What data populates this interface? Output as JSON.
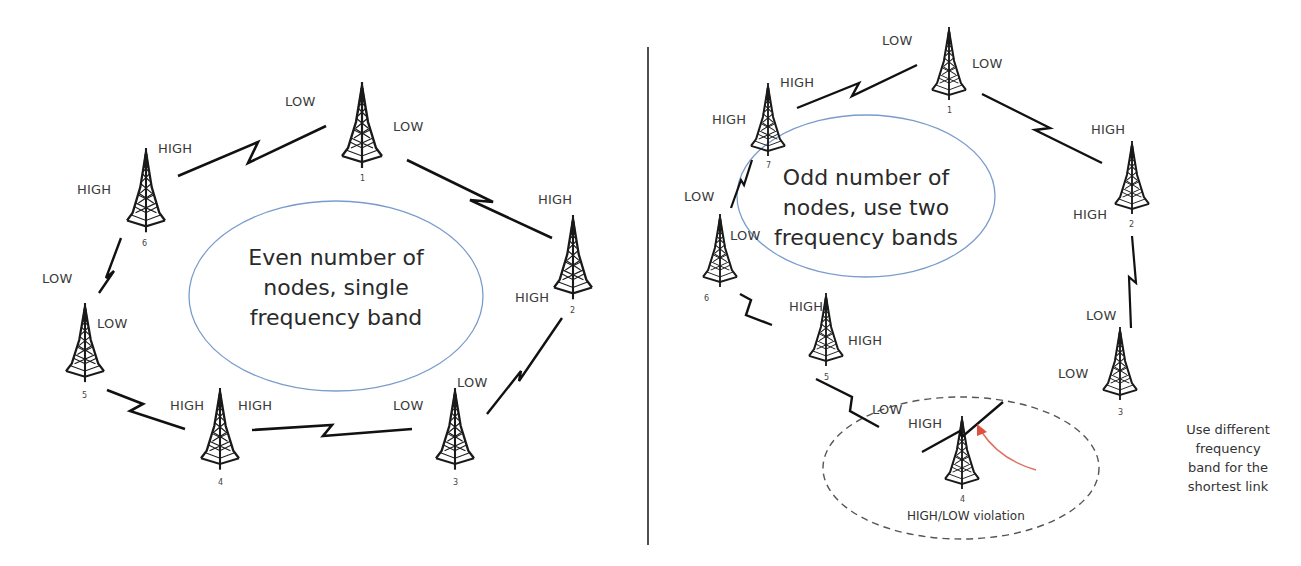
{
  "left_panel": {
    "title_lines": [
      "Even number of",
      "nodes, single",
      "frequency band"
    ],
    "nodes": [
      {
        "id": "1",
        "band_labels": [
          "LOW",
          "LOW"
        ]
      },
      {
        "id": "2",
        "band_labels": [
          "HIGH",
          "HIGH"
        ]
      },
      {
        "id": "3",
        "band_labels": [
          "LOW",
          "LOW"
        ]
      },
      {
        "id": "4",
        "band_labels": [
          "HIGH",
          "HIGH"
        ]
      },
      {
        "id": "5",
        "band_labels": [
          "LOW",
          "LOW"
        ]
      },
      {
        "id": "6",
        "band_labels": [
          "HIGH",
          "HIGH"
        ]
      }
    ],
    "labels": {
      "n1_left": "LOW",
      "n1_right": "LOW",
      "n6_top": "HIGH",
      "n6_left": "HIGH",
      "n2_top": "HIGH",
      "n2_bottom": "HIGH",
      "n5_top": "LOW",
      "n5_right": "LOW",
      "n4_left": "HIGH",
      "n4_right": "HIGH",
      "n3_left": "LOW",
      "n3_top": "LOW"
    }
  },
  "right_panel": {
    "title_lines": [
      "Odd number of",
      "nodes, use two",
      "frequency bands"
    ],
    "nodes": [
      {
        "id": "1"
      },
      {
        "id": "2"
      },
      {
        "id": "3"
      },
      {
        "id": "4"
      },
      {
        "id": "5"
      },
      {
        "id": "6"
      },
      {
        "id": "7"
      }
    ],
    "labels": {
      "n1_left": "LOW",
      "n1_right": "LOW",
      "n7_top": "HIGH",
      "n7_left": "HIGH",
      "n2_top": "HIGH",
      "n2_left": "HIGH",
      "n6_top": "LOW",
      "n6_right": "LOW",
      "n5_top": "HIGH",
      "n5_right": "HIGH",
      "n3_top": "LOW",
      "n3_left": "LOW",
      "n4_left": "LOW",
      "n4_right": "HIGH"
    },
    "violation_label": "HIGH/LOW violation",
    "note_lines": [
      "Use different",
      "frequency",
      "band for the",
      "shortest link"
    ],
    "arrow_color": "#e07060"
  },
  "colors": {
    "ellipse_stroke": "#7a9ccc",
    "tower": "#1a1a1a",
    "link": "#111111",
    "divider": "#222222",
    "dashed": "#555555"
  }
}
